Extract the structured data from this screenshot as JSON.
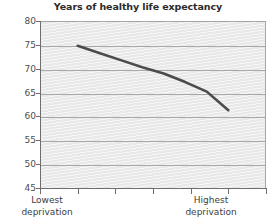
{
  "chart_data": {
    "type": "line",
    "title": "Years of healthy life expectancy",
    "xlabel": "",
    "ylabel": "",
    "ylim": [
      45,
      80
    ],
    "ytick_labels": [
      "80",
      "75",
      "70",
      "65",
      "60",
      "55",
      "50",
      "45"
    ],
    "ytick_values": [
      80,
      75,
      70,
      65,
      60,
      55,
      50,
      45
    ],
    "grid": true,
    "legend": "none",
    "xtick_count": 6,
    "x_axis_categories": [
      "Lowest deprivation",
      "Highest deprivation"
    ],
    "x_start_label_line1": "Lowest",
    "x_start_label_line2": "deprivation",
    "x_end_label_line1": "Highest",
    "x_end_label_line2": "deprivation",
    "series": [
      {
        "name": "Healthy life expectancy",
        "color": "#4b4b4b",
        "x": [
          0.0,
          0.143,
          0.286,
          0.429,
          0.571,
          0.714,
          0.857,
          1.0
        ],
        "values": [
          74.8,
          73.3,
          71.8,
          70.3,
          69.0,
          67.2,
          65.2,
          61.3
        ]
      }
    ]
  }
}
